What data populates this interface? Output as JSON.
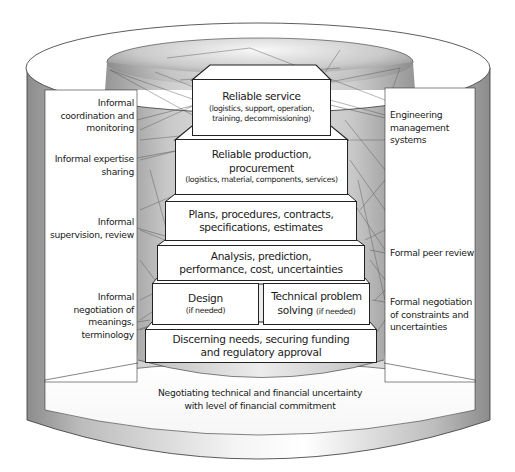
{
  "diagram": {
    "type": "cylinder-pyramid",
    "pyramid_levels": [
      {
        "id": "reliable-service",
        "title": "Reliable service",
        "subtitle": "(logistics, support, operation, training, decommissioning)"
      },
      {
        "id": "reliable-production",
        "title": "Reliable production, procurement",
        "subtitle": "(logistics, material, components, services)"
      },
      {
        "id": "plans",
        "title": "Plans, procedures, contracts, specifications, estimates"
      },
      {
        "id": "analysis",
        "title": "Analysis, prediction, performance, cost, uncertainties"
      },
      {
        "id": "design",
        "title": "Design",
        "subtitle": "(if needed)"
      },
      {
        "id": "technical-problem-solving",
        "title": "Technical problem solving",
        "subtitle": "(if needed)"
      },
      {
        "id": "discerning-needs",
        "title": "Discerning needs, securing funding and regulatory approval"
      }
    ],
    "left_labels": [
      "Informal coordination and monitoring",
      "Informal expertise sharing",
      "Informal supervision, review",
      "Informal negotiation of meanings, terminology"
    ],
    "right_labels": [
      "Engineering management systems",
      "Formal peer review",
      "Formal negotiation of constraints and uncertainties"
    ],
    "base_label": "Negotiating technical and financial uncertainty with level of financial commitment"
  },
  "boxes": {
    "service_title": "Reliable service",
    "service_sub_1": "(logistics, support, operation,",
    "service_sub_2": "training, decommissioning)",
    "production_title_1": "Reliable production,",
    "production_title_2": "procurement",
    "production_sub": "(logistics, material, components, services)",
    "plans_1": "Plans, procedures, contracts,",
    "plans_2": "specifications, estimates",
    "analysis_1": "Analysis, prediction,",
    "analysis_2": "performance, cost, uncertainties",
    "design_title": "Design",
    "design_sub": "(if needed)",
    "tps_title_1": "Technical problem",
    "tps_title_2": "solving",
    "tps_sub": "(if needed)",
    "needs_1": "Discerning needs, securing funding",
    "needs_2": "and regulatory approval"
  },
  "left": {
    "coord_1": "Informal",
    "coord_2": "coordination and",
    "coord_3": "monitoring",
    "expertise_1": "Informal expertise",
    "expertise_2": "sharing",
    "supervision_1": "Informal",
    "supervision_2": "supervision, review",
    "negotiation_1": "Informal",
    "negotiation_2": "negotiation of",
    "negotiation_3": "meanings,",
    "negotiation_4": "terminology"
  },
  "right": {
    "ems_1": "Engineering",
    "ems_2": "management",
    "ems_3": "systems",
    "peer": "Formal peer review",
    "formal_neg_1": "Formal negotiation",
    "formal_neg_2": "of constraints and",
    "formal_neg_3": "uncertainties"
  },
  "base": {
    "line_1": "Negotiating technical and financial uncertainty",
    "line_2": "with level of financial commitment"
  },
  "colors": {
    "outline": "#222222",
    "wall_dark": "#8a8a8a",
    "wall_light": "#e6e6e6",
    "inner_dark": "#7a7a7a",
    "inner_light": "#f2f2f2",
    "panel": "#ffffff"
  }
}
